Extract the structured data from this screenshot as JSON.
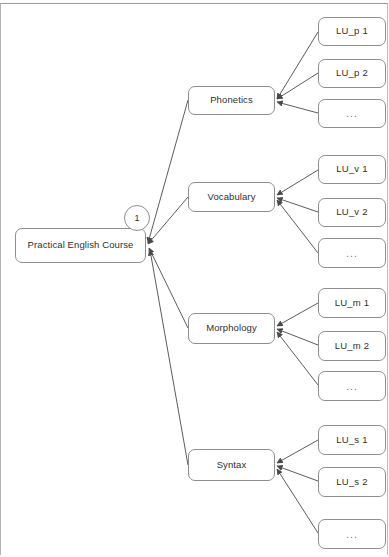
{
  "diagram": {
    "type": "tree",
    "title_text": "Practical English Course",
    "orientation": "left-to-right",
    "edge_direction": "child-to-parent",
    "colors": {
      "background": "#ffffff",
      "node_border": "#8e8e8e",
      "node_fill": "#ffffff",
      "edge": "#4a4a4a",
      "text": "#2f2f2f",
      "page_border": "#9a9a9a"
    },
    "root": {
      "label": "Practical English Course",
      "badge": "1"
    },
    "branches": [
      {
        "label": "Phonetics",
        "leaves": [
          {
            "label": "LU_p 1"
          },
          {
            "label": "LU_p 2"
          },
          {
            "label": "..."
          }
        ]
      },
      {
        "label": "Vocabulary",
        "leaves": [
          {
            "label": "LU_v 1"
          },
          {
            "label": "LU_v 2"
          },
          {
            "label": "..."
          }
        ]
      },
      {
        "label": "Morphology",
        "leaves": [
          {
            "label": "LU_m 1"
          },
          {
            "label": "LU_m 2"
          },
          {
            "label": "..."
          }
        ]
      },
      {
        "label": "Syntax",
        "leaves": [
          {
            "label": "LU_s 1"
          },
          {
            "label": "LU_s 2"
          },
          {
            "label": "..."
          }
        ]
      }
    ]
  }
}
